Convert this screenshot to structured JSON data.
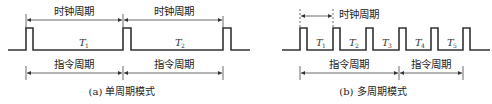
{
  "diagram_a": {
    "clock_cycle_label": "时钟周期",
    "instruction_cycle_label": "指令周期",
    "period_labels": [
      {
        "var": "T",
        "sub": "1"
      },
      {
        "var": "T",
        "sub": "2"
      }
    ],
    "caption": "(a) 单周期模式"
  },
  "diagram_b": {
    "clock_cycle_label": "时钟周期",
    "instruction_cycle_label": "指令周期",
    "period_labels": [
      {
        "var": "T",
        "sub": "1"
      },
      {
        "var": "T",
        "sub": "2"
      },
      {
        "var": "T",
        "sub": "3"
      },
      {
        "var": "T",
        "sub": "4"
      },
      {
        "var": "T",
        "sub": "5"
      }
    ],
    "caption": "(b) 多周期模式"
  },
  "colors": {
    "line": "#333333",
    "text": "#222222",
    "background": "#ffffff"
  }
}
